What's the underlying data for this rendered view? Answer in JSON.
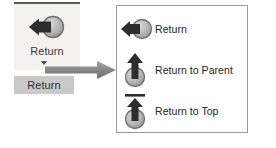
{
  "ribbon": {
    "button_name": "Return",
    "label": "Return",
    "icon": "return-arrow-icon",
    "caret": "chevron-down-icon",
    "tooltip": "Return"
  },
  "connector": {
    "icon": "right-arrow-connector-icon"
  },
  "dropdown": {
    "items": [
      {
        "label": "Return",
        "icon": "return-left-arrow-icon"
      },
      {
        "label": "Return to Parent",
        "icon": "return-to-parent-up-arrow-icon"
      },
      {
        "label": "Return to Top",
        "icon": "return-to-top-up-arrow-bar-icon"
      }
    ]
  },
  "colors": {
    "ribbon_background": "#f3f2f1",
    "ribbon_top_rule": "#5a5a5a",
    "tooltip_background": "#c9c9c9",
    "panel_border": "#9a9a9a",
    "icon_dark": "#2d2d2d",
    "icon_sphere_fill": "#b3b3b3",
    "icon_sphere_stroke": "#6f6f6f",
    "connector_arrow": "#8c8c8c",
    "text": "#242424"
  }
}
